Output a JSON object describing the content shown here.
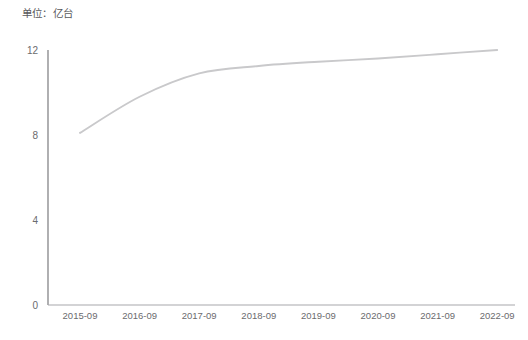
{
  "chart_data": {
    "type": "line",
    "title": "单位：亿台",
    "xlabel": "",
    "ylabel": "",
    "categories": [
      "2015-09",
      "2016-09",
      "2017-09",
      "2018-09",
      "2019-09",
      "2020-09",
      "2021-09",
      "2022-09"
    ],
    "series": [
      {
        "name": "亿台",
        "values": [
          8.1,
          9.8,
          10.9,
          11.25,
          11.45,
          11.6,
          11.8,
          12.0
        ],
        "color": "#c9c9cb"
      }
    ],
    "ylim": [
      0,
      12
    ],
    "yticks": [
      0,
      4,
      8,
      12
    ],
    "ytick_labels": [
      "0",
      "4",
      "8",
      "12"
    ],
    "xtick_labels": [
      "2015-09",
      "2016-09",
      "2017-09",
      "2018-09",
      "2019-09",
      "2020-09",
      "2021-09",
      "2022-09"
    ],
    "grid": false,
    "legend": "none",
    "axis_color": "#9a9a9d",
    "line_color": "#c9c9cb",
    "text_color": "#6b6b6e"
  },
  "axes": {
    "unit_text": "单位：亿台"
  }
}
